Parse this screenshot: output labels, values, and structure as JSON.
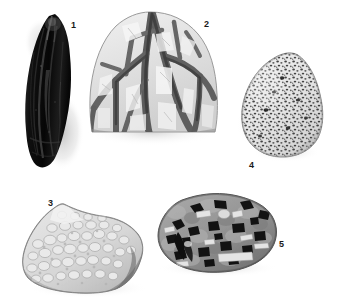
{
  "plate": {
    "background_color": "#ffffff",
    "width": 343,
    "height": 303,
    "label_color": "#1a1a1a"
  },
  "figures": [
    {
      "number": "1",
      "name": "dark-elongated-specimen",
      "description": "Very dark, near-black elongated teardrop-shaped specimen with glossy streaked surface and pointed upper end",
      "tone": "black",
      "texture": "streaked-glassy"
    },
    {
      "number": "2",
      "name": "veined-specimen",
      "description": "Light-toned dome-shaped rock slab cut by dark branching anastomosing veins",
      "tone": "light-gray",
      "texture": "dark-branching-veins"
    },
    {
      "number": "3",
      "name": "granular-specimen",
      "description": "Pale gray angular block with coarse granular pebbly clast texture and darker shaded lower right face",
      "tone": "light-gray",
      "texture": "coarse-granular-clasts"
    },
    {
      "number": "4",
      "name": "vesicular-specimen",
      "description": "Pale ovoid cone-shaped specimen densely covered with small dark vesicles/pores",
      "tone": "light-gray",
      "texture": "fine-dark-vesicles"
    },
    {
      "number": "5",
      "name": "porphyritic-specimen",
      "description": "Mid-gray rounded block containing numerous large black angular phenocrysts and pale lath-shaped crystals",
      "tone": "medium-gray",
      "texture": "black-phenocrysts-in-matrix"
    }
  ]
}
